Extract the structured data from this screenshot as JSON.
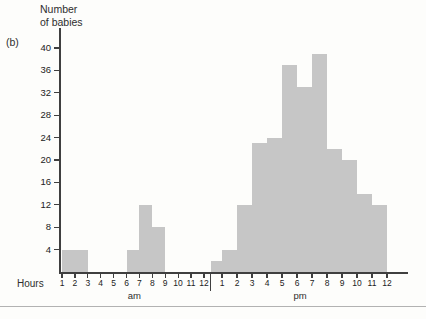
{
  "figure_label": "(b)",
  "y_axis": {
    "title_lines": [
      "Number",
      "of babies"
    ],
    "tick_values": [
      40,
      36,
      32,
      28,
      24,
      20,
      16,
      12,
      8,
      4
    ]
  },
  "x_axis": {
    "label": "Hours",
    "am_ticks": [
      "1",
      "2",
      "3",
      "4",
      "5",
      "6",
      "7",
      "8",
      "9",
      "10",
      "11",
      "12"
    ],
    "pm_ticks": [
      "1",
      "2",
      "3",
      "4",
      "5",
      "6",
      "7",
      "8",
      "9",
      "10",
      "11",
      "12"
    ],
    "am_label": "am",
    "pm_label": "pm"
  },
  "colors": {
    "bar_fill": "#c6c6c6",
    "axis": "#3f3f3f",
    "text": "#2e2e2e",
    "background": "#fdfdfb"
  },
  "chart_data": {
    "type": "bar",
    "subtype": "histogram",
    "title": "",
    "xlabel": "Hours",
    "ylabel": "Number of babies",
    "ylim": [
      0,
      40
    ],
    "ytick_step": 4,
    "grid": false,
    "bins": [
      {
        "period": "am",
        "from": 1,
        "to": 2,
        "label": "1-2 am",
        "value": 4
      },
      {
        "period": "am",
        "from": 2,
        "to": 3,
        "label": "2-3 am",
        "value": 4
      },
      {
        "period": "am",
        "from": 6,
        "to": 7,
        "label": "6-7 am",
        "value": 4
      },
      {
        "period": "am",
        "from": 7,
        "to": 8,
        "label": "7-8 am",
        "value": 12
      },
      {
        "period": "am",
        "from": 8,
        "to": 9,
        "label": "8-9 am",
        "value": 8
      },
      {
        "period": "pm",
        "from": 12,
        "to": 1,
        "label": "12-1 pm",
        "value": 2
      },
      {
        "period": "pm",
        "from": 1,
        "to": 2,
        "label": "1-2 pm",
        "value": 4
      },
      {
        "period": "pm",
        "from": 2,
        "to": 3,
        "label": "2-3 pm",
        "value": 12
      },
      {
        "period": "pm",
        "from": 3,
        "to": 4,
        "label": "3-4 pm",
        "value": 23
      },
      {
        "period": "pm",
        "from": 4,
        "to": 5,
        "label": "4-5 pm",
        "value": 24
      },
      {
        "period": "pm",
        "from": 5,
        "to": 6,
        "label": "5-6 pm",
        "value": 37
      },
      {
        "period": "pm",
        "from": 6,
        "to": 7,
        "label": "6-7 pm",
        "value": 33
      },
      {
        "period": "pm",
        "from": 7,
        "to": 8,
        "label": "7-8 pm",
        "value": 39
      },
      {
        "period": "pm",
        "from": 8,
        "to": 9,
        "label": "8-9 pm",
        "value": 22
      },
      {
        "period": "pm",
        "from": 9,
        "to": 10,
        "label": "9-10 pm",
        "value": 20
      },
      {
        "period": "pm",
        "from": 10,
        "to": 11,
        "label": "10-11 pm",
        "value": 14
      },
      {
        "period": "pm",
        "from": 11,
        "to": 12,
        "label": "11-12 pm",
        "value": 12
      }
    ]
  }
}
